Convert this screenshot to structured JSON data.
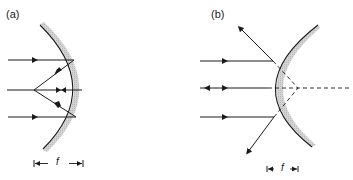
{
  "figure": {
    "panels": [
      {
        "label": "(a)",
        "mirror_type": "concave",
        "focal_label": "f",
        "description": "Parallel rays reflect from concave mirror and converge at focal point"
      },
      {
        "label": "(b)",
        "mirror_type": "convex",
        "focal_label": "f",
        "description": "Parallel rays reflect from convex mirror and diverge, appearing to originate from virtual focal point behind mirror"
      }
    ],
    "colors": {
      "line": "#1a1a1a",
      "mirror_backing": "#c8c8c8"
    }
  }
}
